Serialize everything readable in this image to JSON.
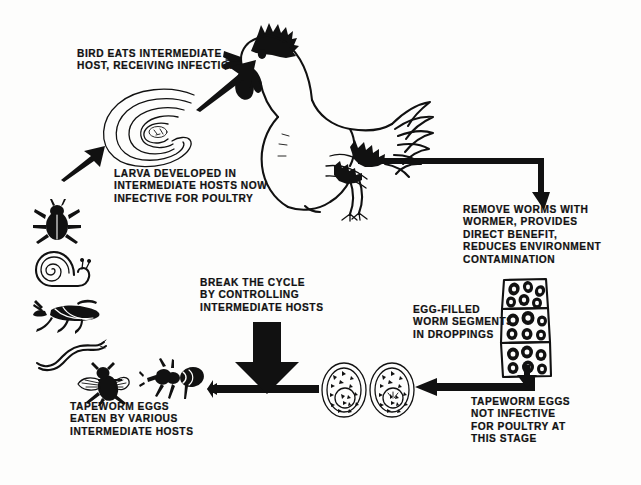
{
  "diagram": {
    "ink_color": "#111111",
    "background_color": "#fdfdfc"
  },
  "captions": {
    "bird_eats": "BIRD EATS INTERMEDIATE\nHOST, RECEIVING INFECTION",
    "larva_developed": "LARVA DEVELOPED IN\nINTERMEDIATE HOSTS NOW\nINFECTIVE FOR POULTRY",
    "remove_worms": "REMOVE WORMS WITH\nWORMER, PROVIDES\nDIRECT BENEFIT,\nREDUCES ENVIRONMENT\nCONTAMINATION",
    "egg_filled": "EGG-FILLED\nWORM SEGMENTS\nIN DROPPINGS",
    "break_cycle": "BREAK THE CYCLE\nBY CONTROLLING\nINTERMEDIATE HOSTS",
    "eggs_not_infective": "TAPEWORM EGGS\nNOT INFECTIVE\nFOR POULTRY AT\nTHIS STAGE",
    "eggs_eaten": "TAPEWORM EGGS\nEATEN BY VARIOUS\nINTERMEDIATE HOSTS"
  },
  "illustrations": {
    "chicken": "chicken-illustration",
    "larva": "coiled-tapeworm-larva-illustration",
    "beetle": "beetle-illustration",
    "snail": "snail-illustration",
    "grasshopper": "grasshopper-illustration",
    "earthworm": "earthworm-illustration",
    "housefly": "housefly-illustration",
    "ant": "ant-illustration",
    "proglottids": "egg-filled-worm-segments-illustration",
    "eggs": "tapeworm-eggs-illustration"
  },
  "arrows": {
    "larva_to_bird": "arrow-larva-to-bird",
    "hosts_to_larva": "arrow-hosts-to-larva",
    "bird_to_wormer": "arrow-bird-to-wormer",
    "wormer_to_segments": "arrow-wormer-to-segments",
    "eggs_to_hosts": "arrow-eggs-to-hosts",
    "segments_to_eggs": "arrow-segments-to-eggs",
    "break_cycle": "arrow-break-the-cycle"
  }
}
